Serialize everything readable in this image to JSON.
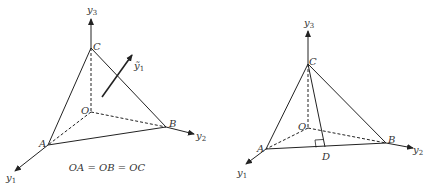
{
  "left_figure": {
    "axes": {
      "y3": {
        "label": "y",
        "sub": "3"
      },
      "y2": {
        "label": "y",
        "sub": "2"
      },
      "y1": {
        "label": "y",
        "sub": "1"
      }
    },
    "points": {
      "C": "C",
      "O": "O",
      "A": "A",
      "B": "B"
    },
    "vector": {
      "label": "ỹ",
      "sub": "1"
    },
    "equation": "OA = OB = OC"
  },
  "right_figure": {
    "axes": {
      "y3": {
        "label": "y",
        "sub": "3"
      },
      "y2": {
        "label": "y",
        "sub": "2"
      },
      "y1": {
        "label": "y",
        "sub": "1"
      }
    },
    "points": {
      "C": "C",
      "O": "O",
      "A": "A",
      "B": "B",
      "D": "D"
    }
  },
  "colors": {
    "stroke": "#222222",
    "text": "#333333"
  }
}
